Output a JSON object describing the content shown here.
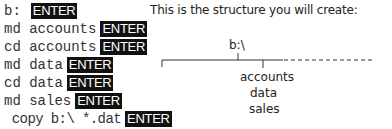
{
  "commands": [
    {
      "text": "b:",
      "key": "ENTER"
    },
    {
      "text": "md accounts",
      "key": "ENTER"
    },
    {
      "text": "cd accounts",
      "key": "ENTER"
    },
    {
      "text": "md data",
      "key": "ENTER"
    },
    {
      "text": "cd data",
      "key": "ENTER"
    },
    {
      "text": "md sales",
      "key": "ENTER"
    },
    {
      "text": " copy b:\\ *.dat",
      "key": "ENTER"
    }
  ],
  "diagram": {
    "heading": "This is the structure you will create:",
    "root": "b:\\",
    "children": [
      "accounts",
      "data",
      "sales"
    ]
  }
}
